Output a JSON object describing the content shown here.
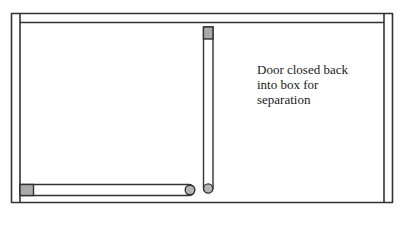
{
  "diagram": {
    "type": "box-with-doors",
    "annotation": {
      "lines": [
        "Door closed back",
        "into box for",
        "separation"
      ]
    },
    "colors": {
      "stroke": "#333333",
      "door_cap_fill": "#aaaaaa",
      "hinge_fill": "#b5b5b5",
      "background": "#ffffff"
    },
    "elements": {
      "box": "outer-frame",
      "top_wall": "lid-panel",
      "left_wall": "left-panel",
      "right_wall": "right-panel",
      "vertical_door": "closed-door",
      "horizontal_door": "floor-door"
    }
  }
}
